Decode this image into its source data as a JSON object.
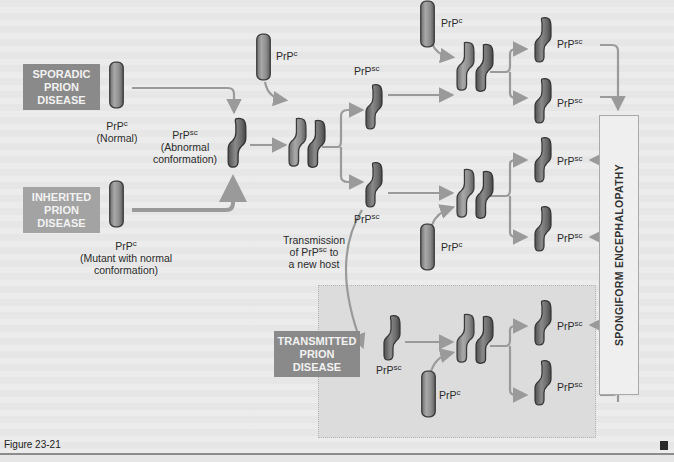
{
  "figure": {
    "caption": "Figure 23-21",
    "end_marker": "■"
  },
  "sources": {
    "sporadic": {
      "line1": "SPORADIC",
      "line2": "PRION",
      "line3": "DISEASE"
    },
    "inherited": {
      "line1": "INHERITED",
      "line2": "PRION",
      "line3": "DISEASE"
    },
    "transmitted": {
      "line1": "TRANSMITTED",
      "line2": "PRION",
      "line3": "DISEASE"
    }
  },
  "labels": {
    "prp": "PrP",
    "c": "c",
    "sc": "sc",
    "normal": "(Normal)",
    "abnormal_1": "(Abnormal",
    "abnormal_2": "conformation)",
    "mutant_1": "(Mutant with normal",
    "mutant_2": "conformation)",
    "transmission_1": "Transmission",
    "transmission_2_pre": "of PrP",
    "transmission_2_post": " to",
    "transmission_3": "a new host"
  },
  "outcome": {
    "label": "SPONGIFORM ENCEPHALOPATHY"
  },
  "colors": {
    "box_sporadic": "#8a8a8a",
    "box_inherited": "#a3a3a3",
    "box_transmitted": "#8a8a8a",
    "protein_normal": "#8e8e8e",
    "protein_abnormal": "#6e6e6e",
    "arrow": "#9a9a9a",
    "background": "#e9e9e9"
  }
}
